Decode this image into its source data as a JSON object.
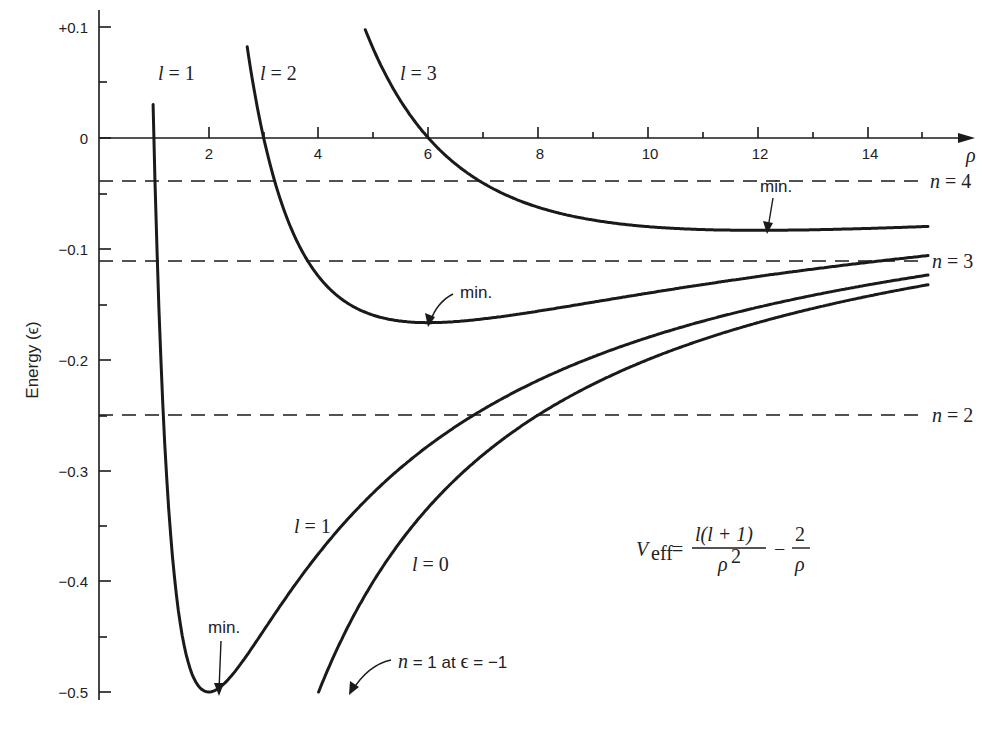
{
  "chart_data": {
    "type": "line",
    "title": "",
    "xlabel": "ρ",
    "ylabel": "Energy (ϵ)",
    "xlim": [
      0,
      15.2
    ],
    "ylim": [
      -0.5,
      0.1
    ],
    "grid": false,
    "x_ticks_major": [
      2,
      4,
      6,
      8,
      10,
      12,
      14
    ],
    "x_ticks_minor": [
      1,
      3,
      5,
      7,
      9,
      11,
      13,
      15
    ],
    "y_ticks": [
      "+0.1",
      "0",
      "-0.1",
      "-0.2",
      "-0.3",
      "-0.4",
      "-0.5"
    ],
    "y_tick_values": [
      0.1,
      0,
      -0.1,
      -0.2,
      -0.3,
      -0.4,
      -0.5
    ],
    "formula": "V_eff = l(l+1)/ρ² − 2/ρ",
    "series": [
      {
        "name": "l = 0",
        "l": 0,
        "rho_start": 4.0,
        "rho_end": 15.1,
        "minimum": null
      },
      {
        "name": "l = 1",
        "l": 1,
        "rho_start": 0.95,
        "rho_end": 15.1,
        "minimum": {
          "rho": 1,
          "energy": -1.0,
          "shown_at": {
            "rho": 2,
            "energy": -0.5
          }
        }
      },
      {
        "name": "l = 2",
        "l": 2,
        "rho_start": 2.7,
        "rho_end": 15.1,
        "minimum": {
          "rho": 6,
          "energy": -0.1667
        }
      },
      {
        "name": "l = 3",
        "l": 3,
        "rho_start": 4.85,
        "rho_end": 15.1,
        "minimum": {
          "rho": 12,
          "energy": -0.0833
        }
      }
    ],
    "sample_points": {
      "l0": {
        "rho": [
          4,
          6,
          8,
          10,
          12,
          15
        ],
        "energy": [
          -0.5,
          -0.333,
          -0.25,
          -0.2,
          -0.167,
          -0.133
        ]
      },
      "l1": {
        "rho": [
          1,
          1.5,
          2,
          3,
          4,
          6,
          8,
          10,
          15
        ],
        "energy": [
          0.0,
          -0.444,
          -0.5,
          -0.444,
          -0.375,
          -0.278,
          -0.219,
          -0.18,
          -0.124
        ]
      },
      "l2": {
        "rho": [
          3,
          4,
          5,
          6,
          8,
          10,
          15
        ],
        "energy": [
          0.0,
          -0.125,
          -0.16,
          -0.167,
          -0.156,
          -0.14,
          -0.107
        ]
      },
      "l3": {
        "rho": [
          6,
          8,
          10,
          12,
          15
        ],
        "energy": [
          0.0,
          -0.0625,
          -0.08,
          -0.0833,
          -0.08
        ]
      }
    },
    "reference_levels": [
      {
        "label": "n = 2",
        "n": 2,
        "energy": -0.25
      },
      {
        "label": "n = 3",
        "n": 3,
        "energy": -0.1111
      },
      {
        "label": "n = 4",
        "n": 4,
        "energy": -0.0625
      }
    ],
    "annotations": [
      {
        "text": "min.",
        "target": "l = 1 minimum"
      },
      {
        "text": "min.",
        "target": "l = 2 minimum"
      },
      {
        "text": "min.",
        "target": "l = 3 minimum"
      },
      {
        "text": "n = 1 at ϵ = −1",
        "target": "l = 0 curve end"
      }
    ]
  },
  "labels": {
    "x_axis": "ρ",
    "y_axis": "Energy (ϵ)",
    "x_ticks": [
      "2",
      "4",
      "6",
      "8",
      "10",
      "12",
      "14"
    ],
    "y_ticks": [
      "+0.1",
      "0",
      "−0.1",
      "−0.2",
      "−0.3",
      "−0.4",
      "−0.5"
    ],
    "curve_l1_top": "l = 1",
    "curve_l2_top": "l = 2",
    "curve_l3_top": "l = 3",
    "curve_l1_bottom": "l = 1",
    "curve_l0": "l = 0",
    "level_n4": "n = 4",
    "level_n3": "n = 3",
    "level_n2": "n = 2",
    "min_l1": "min.",
    "min_l2": "min.",
    "min_l3": "min.",
    "n1_note": "n = 1 at ϵ = −1",
    "formula_lhs": "V",
    "formula_sub": "eff",
    "formula_num": "l(l + 1)",
    "formula_den": "ρ",
    "formula_den_exp": "2",
    "formula_num2": "2",
    "formula_den2": "ρ"
  },
  "style": {
    "ink": "#1a1a1a",
    "background": "#ffffff"
  }
}
